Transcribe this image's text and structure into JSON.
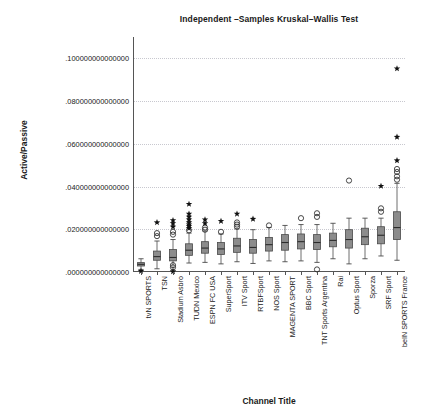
{
  "chart_data": {
    "type": "box",
    "title": "Independent –Samples Kruskal–Wallis Test",
    "xlabel": "Channel Title",
    "ylabel": "Active/Passive",
    "ylim": [
      0.0,
      0.11
    ],
    "grid": true,
    "legend": "none",
    "ytick_labels": [
      ".100000000000000",
      ".080000000000000",
      ".060000000000000",
      ".040000000000000",
      ".020000000000000",
      ".000000000000000"
    ],
    "ytick_values": [
      0.1,
      0.08,
      0.06,
      0.04,
      0.02,
      0.0
    ],
    "categories": [
      "tvN SPORTS",
      "TSN",
      "Stadium Asbro",
      "TUDN Mexico",
      "ESPN FC USA",
      "SuperSport",
      "ITV Sport",
      "RTBFSport",
      "NOS Sport",
      "MAGENTA SPORT",
      "BBC Sport",
      "TNT Sports Argentina",
      "Rai",
      "Optus Sport",
      "Sporza",
      "SRF Sport",
      "beIN SPORTS France"
    ],
    "series": [
      {
        "name": "tvN SPORTS",
        "q1": 0.0028,
        "median": 0.0036,
        "q3": 0.0044,
        "whisker_low": 0.0012,
        "whisker_high": 0.0062,
        "outlier_circles": [],
        "outlier_stars": [
          0.0004
        ]
      },
      {
        "name": "TSN",
        "q1": 0.0055,
        "median": 0.0072,
        "q3": 0.0098,
        "whisker_low": 0.0015,
        "whisker_high": 0.0145,
        "outlier_circles": [
          0.0168,
          0.0182
        ],
        "outlier_stars": [
          0.0232
        ]
      },
      {
        "name": "Stadium Asbro",
        "q1": 0.0052,
        "median": 0.0068,
        "q3": 0.0105,
        "whisker_low": 0.0008,
        "whisker_high": 0.0152,
        "outlier_circles": [
          0.0022,
          0.0032,
          0.0175,
          0.0188
        ],
        "outlier_stars": [
          0.0002,
          0.0212,
          0.0228,
          0.0242
        ]
      },
      {
        "name": "TUDN Mexico",
        "q1": 0.0078,
        "median": 0.0102,
        "q3": 0.0132,
        "whisker_low": 0.0042,
        "whisker_high": 0.0182,
        "outlier_circles": [
          0.0195
        ],
        "outlier_stars": [
          0.0205,
          0.0215,
          0.0222,
          0.0232,
          0.0245,
          0.0258,
          0.0272,
          0.0318
        ]
      },
      {
        "name": "ESPN FC USA",
        "q1": 0.0088,
        "median": 0.0112,
        "q3": 0.0142,
        "whisker_low": 0.0045,
        "whisker_high": 0.0192,
        "outlier_circles": [
          0.0198,
          0.0208
        ],
        "outlier_stars": [
          0.0228,
          0.0245
        ]
      },
      {
        "name": "SuperSport",
        "q1": 0.0082,
        "median": 0.0108,
        "q3": 0.0138,
        "whisker_low": 0.0038,
        "whisker_high": 0.0178,
        "outlier_circles": [
          0.0188
        ],
        "outlier_stars": [
          0.0238
        ]
      },
      {
        "name": "ITV Sport",
        "q1": 0.0092,
        "median": 0.0122,
        "q3": 0.0158,
        "whisker_low": 0.0048,
        "whisker_high": 0.0202,
        "outlier_circles": [
          0.0212,
          0.0222,
          0.0232
        ],
        "outlier_stars": [
          0.0272
        ]
      },
      {
        "name": "RTBFSport",
        "q1": 0.0088,
        "median": 0.0115,
        "q3": 0.0152,
        "whisker_low": 0.004,
        "whisker_high": 0.0198,
        "outlier_circles": [],
        "outlier_stars": [
          0.0248
        ]
      },
      {
        "name": "NOS Sport",
        "q1": 0.0098,
        "median": 0.0128,
        "q3": 0.0162,
        "whisker_low": 0.0052,
        "whisker_high": 0.0208,
        "outlier_circles": [
          0.0218
        ],
        "outlier_stars": []
      },
      {
        "name": "MAGENTA SPORT",
        "q1": 0.0102,
        "median": 0.0138,
        "q3": 0.0175,
        "whisker_low": 0.0048,
        "whisker_high": 0.0218,
        "outlier_circles": [],
        "outlier_stars": []
      },
      {
        "name": "BBC Sport",
        "q1": 0.0108,
        "median": 0.0142,
        "q3": 0.0178,
        "whisker_low": 0.0052,
        "whisker_high": 0.0222,
        "outlier_circles": [
          0.0252
        ],
        "outlier_stars": []
      },
      {
        "name": "TNT Sports Argentina",
        "q1": 0.0105,
        "median": 0.0138,
        "q3": 0.0175,
        "whisker_low": 0.0045,
        "whisker_high": 0.0222,
        "outlier_circles": [
          0.0258,
          0.0275,
          0.0012
        ],
        "outlier_stars": []
      },
      {
        "name": "Rai",
        "q1": 0.0118,
        "median": 0.0148,
        "q3": 0.0182,
        "whisker_low": 0.0062,
        "whisker_high": 0.0228,
        "outlier_circles": [],
        "outlier_stars": []
      },
      {
        "name": "Optus Sport",
        "q1": 0.0112,
        "median": 0.0152,
        "q3": 0.0198,
        "whisker_low": 0.0038,
        "whisker_high": 0.0252,
        "outlier_circles": [
          0.0428
        ],
        "outlier_stars": []
      },
      {
        "name": "Sporza",
        "q1": 0.0128,
        "median": 0.0165,
        "q3": 0.0205,
        "whisker_low": 0.0062,
        "whisker_high": 0.0252,
        "outlier_circles": [],
        "outlier_stars": []
      },
      {
        "name": "SRF Sport",
        "q1": 0.0132,
        "median": 0.0172,
        "q3": 0.0212,
        "whisker_low": 0.0075,
        "whisker_high": 0.0252,
        "outlier_circles": [
          0.0282,
          0.0298
        ],
        "outlier_stars": [
          0.0402
        ]
      },
      {
        "name": "beIN SPORTS France",
        "q1": 0.0152,
        "median": 0.0208,
        "q3": 0.0282,
        "whisker_low": 0.0055,
        "whisker_high": 0.0415,
        "outlier_circles": [
          0.0432,
          0.0448,
          0.0468,
          0.0482
        ],
        "outlier_stars": [
          0.0522,
          0.0632,
          0.0952
        ]
      }
    ],
    "colors": {
      "box_fill": "#8c8c8c",
      "box_stroke": "#4a4a4a",
      "median_line": "#2b2b2b",
      "whisker": "#4a4a4a",
      "outlier_star": "#111111",
      "outlier_circle": "#333333",
      "gridline": "#c8c8cf",
      "axis": "#555555",
      "text": "#1a1a1a",
      "background": "#ffffff"
    }
  }
}
